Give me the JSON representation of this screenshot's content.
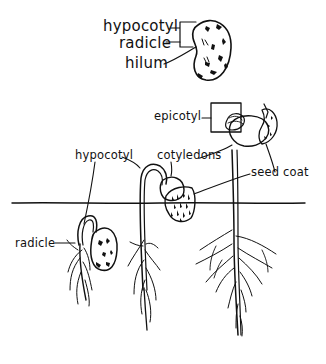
{
  "diagram": {
    "seed_labels": {
      "hypocotyl": "hypocotyl",
      "radicle": "radicle",
      "hilum": "hilum"
    },
    "stage_labels": {
      "epicotyl": "epicotyl",
      "hypocotyl": "hypocotyl",
      "cotyledons": "cotyledons",
      "seed_coat": "seed coat",
      "radicle": "radicle"
    },
    "colors": {
      "ink": "#111111",
      "background": "#ffffff"
    }
  }
}
